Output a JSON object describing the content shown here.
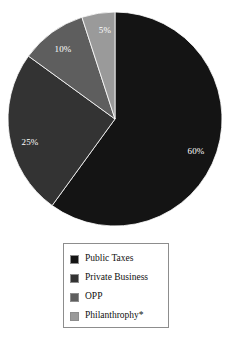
{
  "chart_data": {
    "type": "pie",
    "title": "",
    "labels": [
      "Public Taxes",
      "Private Business",
      "OPP",
      "Philanthrophy*"
    ],
    "values": [
      60,
      25,
      10,
      5
    ],
    "value_labels": [
      "60%",
      "25%",
      "10%",
      "5%"
    ],
    "colors": [
      "#141414",
      "#333333",
      "#5e5e5e",
      "#9a9a9a"
    ],
    "start_angle_deg": 0,
    "direction": "clockwise",
    "legend_position": "bottom",
    "grid": false,
    "units": "percent"
  },
  "pie": {
    "center_x": 115,
    "center_y": 119,
    "radius": 107,
    "slices": [
      {
        "label": "Public Taxes",
        "value_label": "60%",
        "value": 60,
        "color": "#141414",
        "label_x": 196,
        "label_y": 154
      },
      {
        "label": "Private Business",
        "value_label": "25%",
        "value": 25,
        "color": "#333333",
        "label_x": 30,
        "label_y": 145
      },
      {
        "label": "OPP",
        "value_label": "10%",
        "value": 10,
        "color": "#5e5e5e",
        "label_x": 63,
        "label_y": 52
      },
      {
        "label": "Philanthrophy*",
        "value_label": "5%",
        "value": 5,
        "color": "#9a9a9a",
        "label_x": 105,
        "label_y": 33
      }
    ]
  },
  "legend": {
    "items": [
      {
        "label": "Public Taxes",
        "color": "#141414"
      },
      {
        "label": "Private Business",
        "color": "#333333"
      },
      {
        "label": "OPP",
        "color": "#5e5e5e"
      },
      {
        "label": "Philanthrophy*",
        "color": "#9a9a9a"
      }
    ]
  }
}
